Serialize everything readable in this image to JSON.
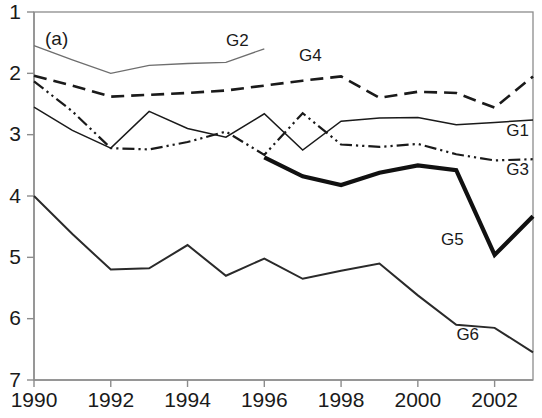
{
  "figure": {
    "panel_label": "(a)",
    "background": "#ffffff"
  },
  "chart_data": {
    "type": "line",
    "title": "",
    "xlabel": "",
    "ylabel": "",
    "y_inverted": true,
    "ylim": [
      1,
      7
    ],
    "xlim": [
      1990,
      2003
    ],
    "grid": false,
    "legend": "inline-labels",
    "x_ticks": [
      1990,
      1992,
      1994,
      1996,
      1998,
      2000,
      2002
    ],
    "y_ticks": [
      1,
      2,
      3,
      4,
      5,
      6,
      7
    ],
    "x": [
      1990,
      1991,
      1992,
      1993,
      1994,
      1995,
      1996,
      1997,
      1998,
      1999,
      2000,
      2001,
      2002,
      2003
    ],
    "series": [
      {
        "name": "G1",
        "style": "solid-thin",
        "color": "#1a1a1a",
        "width": 1.5,
        "label_x": 2002.6,
        "label_y": 2.95,
        "x": [
          1990,
          1991,
          1992,
          1993,
          1994,
          1995,
          1996,
          1997,
          1998,
          1999,
          2000,
          2001,
          2002,
          2003
        ],
        "values": [
          2.55,
          2.93,
          3.22,
          2.62,
          2.9,
          3.04,
          2.66,
          3.25,
          2.78,
          2.73,
          2.72,
          2.84,
          2.8,
          2.76
        ]
      },
      {
        "name": "G2",
        "style": "solid-thin-gray",
        "color": "#6e6e6e",
        "width": 1.3,
        "label_x": 1995.3,
        "label_y": 1.48,
        "x": [
          1990,
          1991,
          1992,
          1993,
          1994,
          1995,
          1996
        ],
        "values": [
          1.55,
          1.78,
          2.0,
          1.87,
          1.84,
          1.82,
          1.6
        ]
      },
      {
        "name": "G3",
        "style": "dash-dot-dot",
        "color": "#1a1a1a",
        "width": 2.2,
        "label_x": 2002.6,
        "label_y": 3.58,
        "x": [
          1990,
          1991,
          1992,
          1993,
          1994,
          1995,
          1996,
          1997,
          1998,
          1999,
          2000,
          2001,
          2002,
          2003
        ],
        "values": [
          2.13,
          2.62,
          3.22,
          3.24,
          3.12,
          2.95,
          3.33,
          2.65,
          3.16,
          3.2,
          3.15,
          3.32,
          3.42,
          3.4
        ]
      },
      {
        "name": "G4",
        "style": "dashed",
        "color": "#1a1a1a",
        "width": 2.6,
        "label_x": 1997.2,
        "label_y": 1.72,
        "x": [
          1990,
          1991,
          1992,
          1993,
          1994,
          1995,
          1996,
          1997,
          1998,
          1999,
          2000,
          2001,
          2002,
          2003
        ],
        "values": [
          2.04,
          2.2,
          2.38,
          2.35,
          2.32,
          2.28,
          2.2,
          2.12,
          2.05,
          2.4,
          2.3,
          2.32,
          2.56,
          2.05
        ]
      },
      {
        "name": "G5",
        "style": "solid-thick",
        "color": "#111111",
        "width": 4.2,
        "label_x": 2000.9,
        "label_y": 4.72,
        "x": [
          1996,
          1997,
          1998,
          1999,
          2000,
          2001,
          2002,
          2003
        ],
        "values": [
          3.37,
          3.68,
          3.82,
          3.62,
          3.5,
          3.58,
          4.96,
          4.33
        ]
      },
      {
        "name": "G6",
        "style": "solid-medium",
        "color": "#2a2a2a",
        "width": 2.0,
        "label_x": 2001.3,
        "label_y": 6.28,
        "x": [
          1990,
          1991,
          1992,
          1993,
          1994,
          1995,
          1996,
          1997,
          1998,
          1999,
          2000,
          2001,
          2002,
          2003
        ],
        "values": [
          4.0,
          4.62,
          5.2,
          5.18,
          4.8,
          5.3,
          5.02,
          5.35,
          5.22,
          5.1,
          5.62,
          6.1,
          6.15,
          6.55
        ]
      }
    ]
  }
}
